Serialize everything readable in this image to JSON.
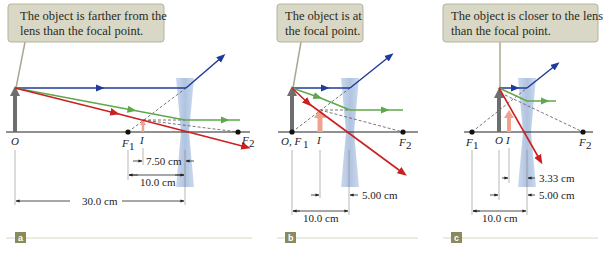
{
  "figure": {
    "type": "ray diagrams, diverging lens",
    "colors": {
      "callout_bg": "#d9d8c6",
      "callout_border": "#b4b39c",
      "ray_blue": "#1f3a9a",
      "ray_green": "#5fa84a",
      "ray_red": "#cc1f1f",
      "object_arrow": "#6e6e6e",
      "image_arrow": "#f0a28e",
      "lens": "#a9bfdc",
      "panel_tag_bg": "#8a8a5c",
      "panel_rule": "#d6d6bd"
    },
    "panels": [
      {
        "tag": "a",
        "callout_line1": "The object is farther from the",
        "callout_line2": "lens than the focal point.",
        "labels": {
          "object": "O",
          "focal1": "F",
          "focal1_sub": "1",
          "image": "I",
          "focal2": "F",
          "focal2_sub": "2"
        },
        "dimensions": {
          "image_distance": "7.50 cm",
          "focal_length": "10.0 cm",
          "object_distance": "30.0 cm"
        }
      },
      {
        "tag": "b",
        "callout_line1": "The object is at",
        "callout_line2": "the focal point.",
        "labels": {
          "object": "O, F",
          "object_sub": "1",
          "image": "I",
          "focal2": "F",
          "focal2_sub": "2"
        },
        "dimensions": {
          "image_distance": "5.00 cm",
          "focal_length": "10.0 cm"
        }
      },
      {
        "tag": "c",
        "callout_line1": "The object is closer to the lens",
        "callout_line2": "than the focal point.",
        "labels": {
          "focal1": "F",
          "focal1_sub": "1",
          "object": "O",
          "image": "I",
          "focal2": "F",
          "focal2_sub": "2"
        },
        "dimensions": {
          "image_distance": "3.33 cm",
          "object_distance": "5.00 cm",
          "focal_length": "10.0 cm"
        }
      }
    ]
  }
}
